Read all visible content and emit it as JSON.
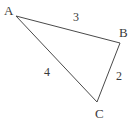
{
  "figure": {
    "type": "triangle-diagram",
    "background_color": "#ffffff",
    "stroke_color": "#4a4a4a",
    "text_color": "#3a3a3a",
    "stroke_width": 1,
    "width": 135,
    "height": 124
  },
  "vertices": {
    "A": {
      "label": "A",
      "x": 16,
      "y": 16
    },
    "B": {
      "label": "B",
      "x": 120,
      "y": 43
    },
    "C": {
      "label": "C",
      "x": 97,
      "y": 102
    }
  },
  "sides": {
    "AB": {
      "label": "3",
      "from": "A",
      "to": "B"
    },
    "AC": {
      "label": "4",
      "from": "A",
      "to": "C"
    },
    "BC": {
      "label": "2",
      "from": "B",
      "to": "C"
    }
  },
  "chart_data": {
    "type": "diagram",
    "title": "",
    "shape": "triangle",
    "vertex_labels": [
      "A",
      "B",
      "C"
    ],
    "vertex_points": [
      [
        16,
        16
      ],
      [
        120,
        43
      ],
      [
        97,
        102
      ]
    ],
    "edge_labels": [
      "3",
      "4",
      "2"
    ],
    "edges": [
      [
        "A",
        "B"
      ],
      [
        "A",
        "C"
      ],
      [
        "B",
        "C"
      ]
    ],
    "edge_lengths": [
      3,
      4,
      2
    ]
  }
}
